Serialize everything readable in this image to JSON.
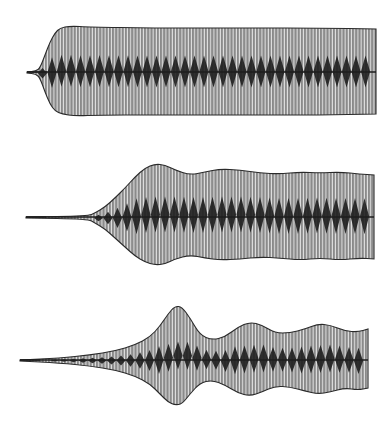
{
  "figure": {
    "panels": 3,
    "colors": {
      "background": "#ffffff",
      "envelope_fill": "#8a8a8a",
      "stripe": "#e6e6e6",
      "core": "#1e1e1e",
      "outline": "#2a2a2a"
    }
  },
  "traces": [
    {
      "name": "trace-top",
      "center_y": 72,
      "lead_start_x": 27,
      "end_x": 376,
      "upper": [
        [
          27,
          72
        ],
        [
          36,
          71
        ],
        [
          40,
          68
        ],
        [
          45,
          55
        ],
        [
          50,
          42
        ],
        [
          55,
          33
        ],
        [
          60,
          28
        ],
        [
          70,
          26
        ],
        [
          90,
          27
        ],
        [
          150,
          28
        ],
        [
          250,
          28
        ],
        [
          320,
          28
        ],
        [
          376,
          29
        ]
      ],
      "lower": [
        [
          27,
          73
        ],
        [
          36,
          74
        ],
        [
          40,
          78
        ],
        [
          45,
          92
        ],
        [
          50,
          104
        ],
        [
          55,
          111
        ],
        [
          62,
          114
        ],
        [
          75,
          116
        ],
        [
          100,
          115
        ],
        [
          150,
          115
        ],
        [
          250,
          115
        ],
        [
          320,
          115
        ],
        [
          376,
          114
        ]
      ],
      "core_amp": 16,
      "core_period": 9.5
    },
    {
      "name": "trace-middle",
      "center_y": 217,
      "lead_start_x": 26,
      "end_x": 374,
      "upper": [
        [
          26,
          217
        ],
        [
          88,
          216
        ],
        [
          95,
          213
        ],
        [
          105,
          207
        ],
        [
          115,
          198
        ],
        [
          125,
          188
        ],
        [
          135,
          177
        ],
        [
          145,
          168
        ],
        [
          155,
          164
        ],
        [
          165,
          165
        ],
        [
          175,
          170
        ],
        [
          190,
          175
        ],
        [
          205,
          172
        ],
        [
          220,
          169
        ],
        [
          240,
          170
        ],
        [
          260,
          173
        ],
        [
          280,
          174
        ],
        [
          300,
          172
        ],
        [
          320,
          173
        ],
        [
          340,
          172
        ],
        [
          360,
          174
        ],
        [
          374,
          175
        ]
      ],
      "lower": [
        [
          26,
          218
        ],
        [
          88,
          219
        ],
        [
          95,
          223
        ],
        [
          105,
          229
        ],
        [
          115,
          238
        ],
        [
          125,
          247
        ],
        [
          135,
          256
        ],
        [
          145,
          262
        ],
        [
          155,
          265
        ],
        [
          165,
          264
        ],
        [
          175,
          259
        ],
        [
          190,
          255
        ],
        [
          205,
          258
        ],
        [
          220,
          260
        ],
        [
          240,
          259
        ],
        [
          260,
          257
        ],
        [
          280,
          258
        ],
        [
          300,
          260
        ],
        [
          320,
          258
        ],
        [
          340,
          260
        ],
        [
          360,
          258
        ],
        [
          374,
          259
        ]
      ],
      "core_amp": 18,
      "core_period": 9.5
    },
    {
      "name": "trace-bottom",
      "center_y": 360,
      "lead_start_x": 20,
      "end_x": 368,
      "upper": [
        [
          20,
          360
        ],
        [
          60,
          358
        ],
        [
          90,
          355
        ],
        [
          115,
          351
        ],
        [
          135,
          345
        ],
        [
          150,
          337
        ],
        [
          160,
          326
        ],
        [
          168,
          314
        ],
        [
          175,
          306
        ],
        [
          182,
          307
        ],
        [
          190,
          318
        ],
        [
          200,
          335
        ],
        [
          212,
          340
        ],
        [
          225,
          337
        ],
        [
          238,
          327
        ],
        [
          250,
          322
        ],
        [
          262,
          325
        ],
        [
          275,
          333
        ],
        [
          290,
          333
        ],
        [
          305,
          329
        ],
        [
          318,
          324
        ],
        [
          330,
          325
        ],
        [
          345,
          331
        ],
        [
          358,
          332
        ],
        [
          368,
          329
        ]
      ],
      "lower": [
        [
          20,
          361
        ],
        [
          60,
          363
        ],
        [
          90,
          366
        ],
        [
          115,
          370
        ],
        [
          135,
          376
        ],
        [
          150,
          384
        ],
        [
          160,
          394
        ],
        [
          168,
          402
        ],
        [
          175,
          405
        ],
        [
          182,
          404
        ],
        [
          190,
          394
        ],
        [
          200,
          383
        ],
        [
          212,
          380
        ],
        [
          225,
          385
        ],
        [
          238,
          393
        ],
        [
          250,
          396
        ],
        [
          262,
          392
        ],
        [
          275,
          386
        ],
        [
          290,
          387
        ],
        [
          305,
          391
        ],
        [
          318,
          394
        ],
        [
          330,
          392
        ],
        [
          345,
          388
        ],
        [
          358,
          390
        ],
        [
          368,
          388
        ]
      ],
      "core_amp": 14,
      "core_period": 9.5
    }
  ]
}
